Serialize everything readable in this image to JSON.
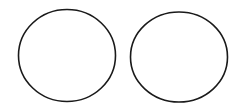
{
  "canvas": {
    "width": 237,
    "height": 103,
    "background": "#ffffff"
  },
  "shapes": [
    {
      "type": "ellipse",
      "cx": 67,
      "cy": 55.5,
      "rx": 48.5,
      "ry": 46,
      "stroke": "#1a1a1a",
      "stroke_width": 1.6,
      "fill": "none"
    },
    {
      "type": "ellipse",
      "cx": 179,
      "cy": 57,
      "rx": 48.5,
      "ry": 45,
      "stroke": "#1a1a1a",
      "stroke_width": 1.6,
      "fill": "none"
    }
  ]
}
